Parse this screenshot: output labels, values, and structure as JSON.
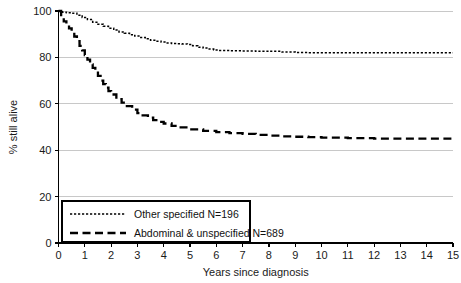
{
  "chart_data": {
    "type": "line",
    "title": "",
    "subtitle": "",
    "xlabel": "Years since diagnosis",
    "ylabel": "% still alive",
    "xlim": [
      0,
      15
    ],
    "ylim": [
      0,
      100
    ],
    "xticks": [
      0,
      1,
      2,
      3,
      4,
      5,
      6,
      7,
      8,
      9,
      10,
      11,
      12,
      13,
      14,
      15
    ],
    "xtick_labels": [
      "0",
      "1",
      "2",
      "3",
      "4",
      "5",
      "6",
      "7",
      "8",
      "9",
      "10",
      "11",
      "12",
      "13",
      "14",
      "15"
    ],
    "yticks": [
      0,
      20,
      40,
      60,
      80,
      100
    ],
    "ytick_labels": [
      "0",
      "20",
      "40",
      "60",
      "80",
      "100"
    ],
    "grid": "horizontal",
    "legend_position": "bottom-left",
    "series": [
      {
        "name": "Other specified N=196",
        "label": "Other specified N=196",
        "group": "Other specified",
        "n": 196,
        "line_style": "dotted",
        "color": "#000000",
        "x": [
          0,
          0.15,
          0.3,
          0.5,
          0.7,
          0.9,
          1.1,
          1.3,
          1.5,
          1.7,
          1.9,
          2.1,
          2.3,
          2.5,
          2.7,
          2.9,
          3.1,
          3.3,
          3.5,
          3.7,
          3.9,
          4.1,
          4.3,
          4.5,
          4.7,
          4.9,
          5.1,
          5.3,
          5.5,
          5.7,
          5.9,
          6.1,
          6.5,
          7.0,
          7.5,
          8.0,
          8.5,
          9.0,
          9.5,
          10.0,
          11.0,
          12.0,
          13.0,
          14.0,
          15.0
        ],
        "y": [
          100,
          99.5,
          99.2,
          99.0,
          98.2,
          97.2,
          96.3,
          95.2,
          94.3,
          93.4,
          92.6,
          91.8,
          91.0,
          90.4,
          89.8,
          89.2,
          88.6,
          88.0,
          87.4,
          87.0,
          86.6,
          86.2,
          86.0,
          85.9,
          85.8,
          85.6,
          85.0,
          84.4,
          84.0,
          83.6,
          83.2,
          83.0,
          82.9,
          82.8,
          82.7,
          82.6,
          82.3,
          82.1,
          82.0,
          82.0,
          82.0,
          82.0,
          82.0,
          82.0,
          82.0
        ]
      },
      {
        "name": "Abdominal & unspecified N=689",
        "label": "Abdominal & unspecified N=689",
        "group": "Abdominal & unspecified",
        "n": 689,
        "line_style": "dashed",
        "color": "#000000",
        "x": [
          0,
          0.1,
          0.2,
          0.3,
          0.4,
          0.5,
          0.6,
          0.7,
          0.8,
          0.9,
          1.0,
          1.1,
          1.2,
          1.3,
          1.4,
          1.5,
          1.6,
          1.7,
          1.8,
          1.9,
          2.0,
          2.2,
          2.4,
          2.6,
          2.8,
          3.0,
          3.2,
          3.4,
          3.6,
          3.8,
          4.0,
          4.3,
          4.6,
          5.0,
          5.5,
          6.0,
          6.5,
          7.0,
          7.5,
          8.0,
          8.5,
          9.0,
          9.5,
          10.0,
          11.0,
          12.0,
          13.0,
          14.0,
          15.0
        ],
        "y": [
          100,
          97.5,
          95.5,
          94.0,
          92.5,
          91.0,
          89.0,
          87.0,
          85.0,
          83.0,
          81.0,
          79.0,
          77.0,
          75.5,
          74.0,
          72.0,
          70.0,
          68.5,
          67.0,
          65.5,
          64.0,
          62.0,
          60.5,
          59.0,
          57.5,
          56.0,
          55.0,
          54.0,
          53.0,
          52.2,
          51.5,
          50.5,
          49.8,
          49.0,
          48.3,
          47.8,
          47.4,
          47.0,
          46.6,
          46.3,
          46.0,
          45.8,
          45.6,
          45.4,
          45.2,
          45.0,
          45.0,
          45.0,
          45.0
        ]
      }
    ]
  },
  "axes": {
    "x_axis_title": "Years since diagnosis",
    "y_axis_title": "% still alive"
  },
  "legend": {
    "entries": [
      {
        "label": "Other specified N=196",
        "style": "dotted"
      },
      {
        "label": "Abdominal & unspecified N=689",
        "style": "dashed"
      }
    ]
  },
  "colors": {
    "line": "#000000",
    "grid": "#c8c8c8",
    "axis": "#000000",
    "background": "#ffffff"
  }
}
